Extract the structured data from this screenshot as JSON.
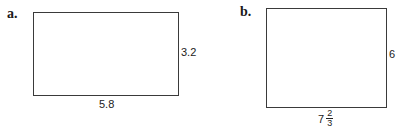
{
  "figures": [
    {
      "label": "a.",
      "shape": "rectangle",
      "height_label": "3.2",
      "width_label": "5.8"
    },
    {
      "label": "b.",
      "shape": "rectangle",
      "height_label": "6",
      "width_label": {
        "whole": "7",
        "numerator": "2",
        "denominator": "3"
      }
    }
  ]
}
